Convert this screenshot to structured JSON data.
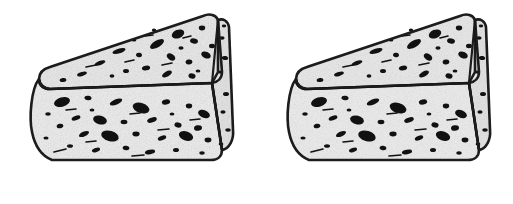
{
  "scene": {
    "title": "Two cheese wedges",
    "subject": "cheese-wedge",
    "description": "Black-and-white line drawing of two identical triangular cheese wedges with speckled holes",
    "style": "ink line art",
    "object_count": 2,
    "canvas": {
      "width": 513,
      "height": 204
    },
    "alt_text": "Two identical hand-drawn triangular cheese wedges side by side"
  },
  "colors": {
    "background": "#ffffff",
    "outline": "#1a1a1a",
    "top_face_fill": "#e8e8e8",
    "front_face_fill": "#ececec",
    "side_face_fill": "#e2e2e2",
    "spot": "#111111",
    "speckle": "#8a8a8a"
  },
  "geometry": {
    "outline_width": 2.6,
    "inner_line_width": 2.2,
    "wedge_width": 200,
    "wedge_height": 152
  },
  "objects": [
    {
      "name": "cheese-wedge-left",
      "label": "Cheese wedge 1",
      "offset_x": 26,
      "offset_y": 10,
      "faces": [
        "top-face",
        "front-face",
        "right-side-face"
      ]
    },
    {
      "name": "cheese-wedge-right",
      "label": "Cheese wedge 2",
      "offset_x": 283,
      "offset_y": 10,
      "faces": [
        "top-face",
        "front-face",
        "right-side-face"
      ]
    }
  ],
  "wedge_shape": {
    "top_face_path": "M 13,69 C 13,63 17,59 24,57 L 177,6 C 184,3 190,5 192,10 L 196,62 C 196,68 192,72 186,73 L 24,79 C 17,79 13,75 13,69 Z",
    "front_face_path": "M 13,69 C 5,79 3,108 6,122 C 9,137 16,146 26,150 L 185,150 C 192,150 196,146 196,140 L 186,73 L 24,79 C 17,79 13,75 13,69 Z",
    "side_face_path": "M 192,10 C 197,8 202,11 203,17 L 207,120 C 208,130 203,139 196,140 L 186,73 L 192,62 Z",
    "divider_path": "M 13,69 C 14,74 18,78 24,79 L 186,73",
    "ridge_path": "M 192,10 L 186,73 L 196,140"
  },
  "spots": {
    "top_face": [
      {
        "cx": 152,
        "cy": 24,
        "rx": 6.5,
        "ry": 4.2,
        "rot": -22
      },
      {
        "cx": 168,
        "cy": 31,
        "rx": 4.0,
        "ry": 2.6,
        "rot": 14
      },
      {
        "cx": 131,
        "cy": 34,
        "rx": 7.8,
        "ry": 3.4,
        "rot": -30
      },
      {
        "cx": 176,
        "cy": 18,
        "rx": 3.2,
        "ry": 2.4,
        "rot": 0
      },
      {
        "cx": 113,
        "cy": 45,
        "rx": 3.0,
        "ry": 2.2,
        "rot": 10
      },
      {
        "cx": 93,
        "cy": 41,
        "rx": 6.8,
        "ry": 2.4,
        "rot": -18
      },
      {
        "cx": 145,
        "cy": 47,
        "rx": 4.6,
        "ry": 3.0,
        "rot": 36
      },
      {
        "cx": 163,
        "cy": 52,
        "rx": 3.4,
        "ry": 2.4,
        "rot": -8
      },
      {
        "cx": 180,
        "cy": 45,
        "rx": 5.0,
        "ry": 3.2,
        "rot": 24
      },
      {
        "cx": 120,
        "cy": 58,
        "rx": 4.2,
        "ry": 2.4,
        "rot": -12
      },
      {
        "cx": 100,
        "cy": 61,
        "rx": 3.0,
        "ry": 2.0,
        "rot": 0
      },
      {
        "cx": 141,
        "cy": 64,
        "rx": 5.4,
        "ry": 2.6,
        "rot": -28
      },
      {
        "cx": 166,
        "cy": 66,
        "rx": 3.6,
        "ry": 2.6,
        "rot": 16
      },
      {
        "cx": 74,
        "cy": 53,
        "rx": 5.6,
        "ry": 2.2,
        "rot": -20
      },
      {
        "cx": 56,
        "cy": 64,
        "rx": 5.0,
        "ry": 2.0,
        "rot": -16
      },
      {
        "cx": 37,
        "cy": 70,
        "rx": 3.4,
        "ry": 2.0,
        "rot": -10
      },
      {
        "cx": 186,
        "cy": 36,
        "rx": 3.0,
        "ry": 2.2,
        "rot": 0
      },
      {
        "cx": 155,
        "cy": 38,
        "rx": 2.6,
        "ry": 1.8,
        "rot": 0
      },
      {
        "cx": 108,
        "cy": 30,
        "rx": 2.4,
        "ry": 1.6,
        "rot": 0
      },
      {
        "cx": 128,
        "cy": 20,
        "rx": 2.2,
        "ry": 1.6,
        "rot": 0
      },
      {
        "cx": 86,
        "cy": 66,
        "rx": 2.4,
        "ry": 1.8,
        "rot": 0
      },
      {
        "cx": 172,
        "cy": 61,
        "rx": 2.4,
        "ry": 1.6,
        "rot": 0
      }
    ],
    "front_face": [
      {
        "cx": 36,
        "cy": 92,
        "rx": 8.2,
        "ry": 4.6,
        "rot": -16
      },
      {
        "cx": 62,
        "cy": 88,
        "rx": 3.6,
        "ry": 2.2,
        "rot": 8
      },
      {
        "cx": 90,
        "cy": 92,
        "rx": 6.6,
        "ry": 2.6,
        "rot": -22
      },
      {
        "cx": 115,
        "cy": 98,
        "rx": 8.6,
        "ry": 5.0,
        "rot": 18
      },
      {
        "cx": 140,
        "cy": 92,
        "rx": 4.2,
        "ry": 2.6,
        "rot": -10
      },
      {
        "cx": 163,
        "cy": 96,
        "rx": 3.2,
        "ry": 2.4,
        "rot": 0
      },
      {
        "cx": 178,
        "cy": 104,
        "rx": 6.2,
        "ry": 3.8,
        "rot": 22
      },
      {
        "cx": 50,
        "cy": 108,
        "rx": 4.6,
        "ry": 2.2,
        "rot": -20
      },
      {
        "cx": 74,
        "cy": 110,
        "rx": 7.0,
        "ry": 4.4,
        "rot": 14
      },
      {
        "cx": 98,
        "cy": 112,
        "rx": 3.4,
        "ry": 2.2,
        "rot": 0
      },
      {
        "cx": 126,
        "cy": 110,
        "rx": 5.0,
        "ry": 2.4,
        "rot": -18
      },
      {
        "cx": 152,
        "cy": 115,
        "rx": 3.6,
        "ry": 2.6,
        "rot": 10
      },
      {
        "cx": 172,
        "cy": 118,
        "rx": 4.0,
        "ry": 2.8,
        "rot": -6
      },
      {
        "cx": 34,
        "cy": 116,
        "rx": 3.4,
        "ry": 2.2,
        "rot": -14
      },
      {
        "cx": 58,
        "cy": 124,
        "rx": 5.4,
        "ry": 2.4,
        "rot": -24
      },
      {
        "cx": 84,
        "cy": 126,
        "rx": 9.0,
        "ry": 5.2,
        "rot": 16
      },
      {
        "cx": 110,
        "cy": 124,
        "rx": 3.6,
        "ry": 2.4,
        "rot": 0
      },
      {
        "cx": 136,
        "cy": 128,
        "rx": 4.4,
        "ry": 2.2,
        "rot": -20
      },
      {
        "cx": 160,
        "cy": 126,
        "rx": 7.4,
        "ry": 4.6,
        "rot": 20
      },
      {
        "cx": 182,
        "cy": 130,
        "rx": 3.4,
        "ry": 2.4,
        "rot": 0
      },
      {
        "cx": 44,
        "cy": 136,
        "rx": 3.0,
        "ry": 1.8,
        "rot": 0
      },
      {
        "cx": 70,
        "cy": 140,
        "rx": 4.2,
        "ry": 2.0,
        "rot": -18
      },
      {
        "cx": 100,
        "cy": 138,
        "rx": 3.4,
        "ry": 2.2,
        "rot": 10
      },
      {
        "cx": 124,
        "cy": 142,
        "rx": 5.2,
        "ry": 2.2,
        "rot": -12
      },
      {
        "cx": 150,
        "cy": 140,
        "rx": 3.0,
        "ry": 2.0,
        "rot": 0
      },
      {
        "cx": 176,
        "cy": 143,
        "rx": 2.8,
        "ry": 1.8,
        "rot": 0
      },
      {
        "cx": 22,
        "cy": 104,
        "rx": 2.8,
        "ry": 1.8,
        "rot": 0
      },
      {
        "cx": 20,
        "cy": 128,
        "rx": 2.6,
        "ry": 1.6,
        "rot": 0
      },
      {
        "cx": 146,
        "cy": 104,
        "rx": 2.4,
        "ry": 1.6,
        "rot": 0
      },
      {
        "cx": 66,
        "cy": 100,
        "rx": 2.4,
        "ry": 1.6,
        "rot": 0
      }
    ],
    "side_face": [
      {
        "cx": 196,
        "cy": 28,
        "rx": 2.6,
        "ry": 1.8,
        "rot": 0
      },
      {
        "cx": 199,
        "cy": 48,
        "rx": 3.2,
        "ry": 2.0,
        "rot": 10
      },
      {
        "cx": 194,
        "cy": 62,
        "rx": 2.4,
        "ry": 1.6,
        "rot": 0
      },
      {
        "cx": 200,
        "cy": 84,
        "rx": 3.0,
        "ry": 2.0,
        "rot": 0
      },
      {
        "cx": 197,
        "cy": 102,
        "rx": 2.6,
        "ry": 1.8,
        "rot": 0
      },
      {
        "cx": 202,
        "cy": 120,
        "rx": 2.8,
        "ry": 1.8,
        "rot": 0
      },
      {
        "cx": 195,
        "cy": 134,
        "rx": 2.4,
        "ry": 1.6,
        "rot": 0
      },
      {
        "cx": 198,
        "cy": 16,
        "rx": 2.2,
        "ry": 1.4,
        "rot": 0
      }
    ]
  },
  "dashes": {
    "top_face": [
      {
        "x1": 99,
        "y1": 52,
        "x2": 108,
        "y2": 50
      },
      {
        "x1": 136,
        "y1": 55,
        "x2": 146,
        "y2": 53
      },
      {
        "x1": 60,
        "y1": 57,
        "x2": 70,
        "y2": 55
      },
      {
        "x1": 157,
        "y1": 28,
        "x2": 165,
        "y2": 26
      },
      {
        "x1": 119,
        "y1": 26,
        "x2": 127,
        "y2": 25
      }
    ],
    "front_face": [
      {
        "x1": 40,
        "y1": 100,
        "x2": 50,
        "y2": 99
      },
      {
        "x1": 104,
        "y1": 104,
        "x2": 114,
        "y2": 103
      },
      {
        "x1": 60,
        "y1": 132,
        "x2": 70,
        "y2": 131
      },
      {
        "x1": 132,
        "y1": 120,
        "x2": 143,
        "y2": 119
      },
      {
        "x1": 28,
        "y1": 142,
        "x2": 40,
        "y2": 139
      },
      {
        "x1": 106,
        "y1": 146,
        "x2": 118,
        "y2": 145
      },
      {
        "x1": 164,
        "y1": 110,
        "x2": 174,
        "y2": 109
      }
    ]
  }
}
